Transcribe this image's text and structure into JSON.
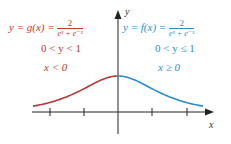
{
  "chart_data": {
    "type": "line",
    "title": "",
    "xlabel": "x",
    "ylabel": "y",
    "x_ticks": [
      -2,
      -1,
      0,
      1,
      2
    ],
    "xlim": [
      -2.5,
      2.8
    ],
    "ylim": [
      -0.6,
      2.8
    ],
    "grid": false,
    "series": [
      {
        "name": "y = g(x) = 2/(e^x + e^-x)",
        "domain": "x < 0",
        "range": "0 < y < 1",
        "color": "#b23a3a",
        "x": [
          -2.5,
          -2,
          -1.5,
          -1,
          -0.5,
          0
        ],
        "y": [
          0.163,
          0.266,
          0.425,
          0.648,
          0.887,
          1.0
        ]
      },
      {
        "name": "y = f(x) = 2/(e^x + e^-x)",
        "domain": "x ≥ 0",
        "range": "0 < y ≤ 1",
        "color": "#2b8fc9",
        "x": [
          0,
          0.5,
          1,
          1.5,
          2,
          2.5
        ],
        "y": [
          1.0,
          0.887,
          0.648,
          0.425,
          0.266,
          0.163
        ]
      }
    ]
  },
  "labels": {
    "left": {
      "lhs": "y = g(x) =",
      "num": "2",
      "den": "eˣ + e⁻ˣ",
      "range": "0 < y < 1",
      "domain": "x < 0"
    },
    "right": {
      "lhs": "y = f(x) =",
      "num": "2",
      "den": "eˣ + e⁻ˣ",
      "range": "0 < y ≤ 1",
      "domain": "x ≥ 0"
    },
    "x_axis": "x",
    "y_axis": "y"
  },
  "colors": {
    "left_curve": "#b23a3a",
    "left_text": "#c0392b",
    "right_curve": "#2b8fc9",
    "right_text": "#2b8fc9",
    "axis": "#222222"
  }
}
